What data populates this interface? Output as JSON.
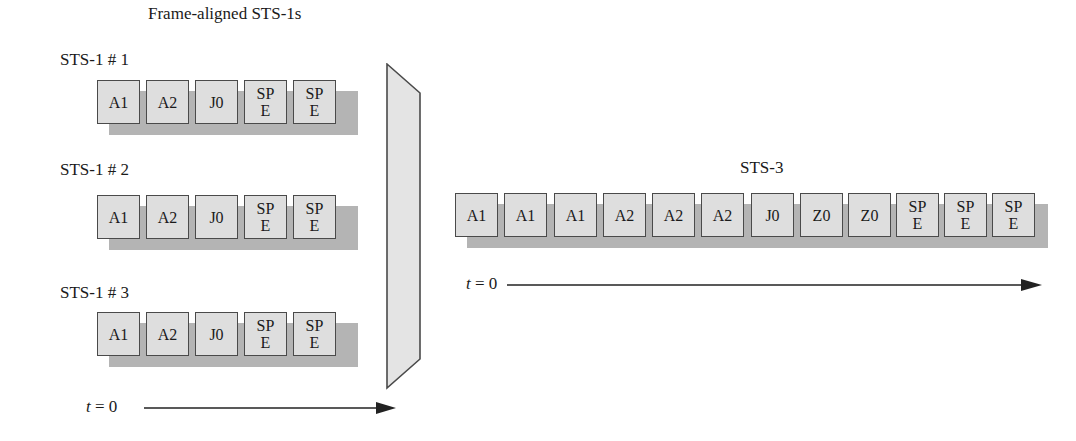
{
  "left_panel": {
    "title": "Frame-aligned STS-1s",
    "streams": [
      {
        "label": "STS-1 # 1",
        "cells": [
          "A1",
          "A2",
          "J0",
          "SP\nE",
          "SP\nE"
        ]
      },
      {
        "label": "STS-1 # 2",
        "cells": [
          "A1",
          "A2",
          "J0",
          "SP\nE",
          "SP\nE"
        ]
      },
      {
        "label": "STS-1 # 3",
        "cells": [
          "A1",
          "A2",
          "J0",
          "SP\nE",
          "SP\nE"
        ]
      }
    ],
    "time_axis": {
      "var": "t",
      "eq": " = 0"
    }
  },
  "multiplexer": {
    "shape": "trapezoid"
  },
  "right_panel": {
    "title": "STS-3",
    "cells": [
      "A1",
      "A1",
      "A1",
      "A2",
      "A2",
      "A2",
      "J0",
      "Z0",
      "Z0",
      "SP\nE",
      "SP\nE",
      "SP\nE"
    ],
    "time_axis": {
      "var": "t",
      "eq": " = 0"
    }
  },
  "colors": {
    "cell_fill": "#dedede",
    "cell_border": "#4a4a4a",
    "shadow": "#b4b4b4",
    "mux_fill": "#e4e4e4"
  }
}
